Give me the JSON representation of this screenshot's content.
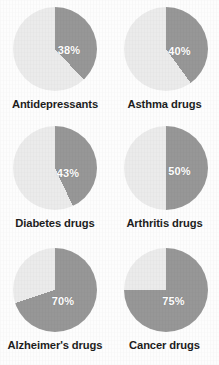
{
  "figure": {
    "background_color": "#fdfdfd",
    "label_color": "#1d1d1d",
    "value_text_color": "#ffffff"
  },
  "chart_data": {
    "type": "pie",
    "title": "",
    "subtitle": "",
    "xlabel": "",
    "ylabel": "",
    "legend": [],
    "legend_position": "none",
    "grid": false,
    "layout": {
      "columns": 2,
      "rows": 3,
      "start_angle_deg": 0,
      "direction": "clockwise"
    },
    "slice_colors": {
      "highlight": "#979797",
      "remainder": "#ebebeb"
    },
    "categories": [
      "Antidepressants",
      "Asthma drugs",
      "Diabetes drugs",
      "Arthritis drugs",
      "Alzheimer's drugs",
      "Cancer drugs"
    ],
    "values": [
      38,
      40,
      43,
      50,
      70,
      75
    ],
    "value_labels": [
      "38%",
      "40%",
      "43%",
      "50%",
      "70%",
      "75%"
    ],
    "charts": [
      {
        "label": "Antidepressants",
        "value": 38,
        "value_label": "38%",
        "remainder": 62,
        "label_pos": {
          "x": 56,
          "y": 43
        }
      },
      {
        "label": "Asthma drugs",
        "value": 40,
        "value_label": "40%",
        "remainder": 60,
        "label_pos": {
          "x": 56,
          "y": 44
        }
      },
      {
        "label": "Diabetes drugs",
        "value": 43,
        "value_label": "43%",
        "remainder": 57,
        "label_pos": {
          "x": 55,
          "y": 47
        }
      },
      {
        "label": "Arthritis drugs",
        "value": 50,
        "value_label": "50%",
        "remainder": 50,
        "label_pos": {
          "x": 56,
          "y": 45
        }
      },
      {
        "label": "Alzheimer's drugs",
        "value": 70,
        "value_label": "70%",
        "remainder": 30,
        "label_pos": {
          "x": 50,
          "y": 53
        }
      },
      {
        "label": "Cancer drugs",
        "value": 75,
        "value_label": "75%",
        "remainder": 25,
        "label_pos": {
          "x": 50,
          "y": 53
        }
      }
    ]
  }
}
